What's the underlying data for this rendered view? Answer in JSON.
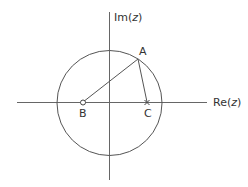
{
  "diagram": {
    "type": "complex-plane",
    "axes": {
      "real_label_prefix": "Re(",
      "real_label_var": "z",
      "real_label_suffix": ")",
      "imag_label_prefix": "Im(",
      "imag_label_var": "z",
      "imag_label_suffix": ")"
    },
    "circle": {
      "cx": 109.5,
      "cy": 103,
      "r": 52.5
    },
    "points": {
      "A": {
        "label": "A",
        "x": 138,
        "y": 59,
        "marker": "none"
      },
      "B": {
        "label": "B",
        "x": 83,
        "y": 102,
        "marker": "open-circle"
      },
      "C": {
        "label": "C",
        "x": 147,
        "y": 102,
        "marker": "cross"
      }
    },
    "segments": [
      {
        "from": "B",
        "to": "A"
      },
      {
        "from": "A",
        "to": "C"
      }
    ],
    "colors": {
      "line": "#555555",
      "text": "#333333"
    }
  }
}
